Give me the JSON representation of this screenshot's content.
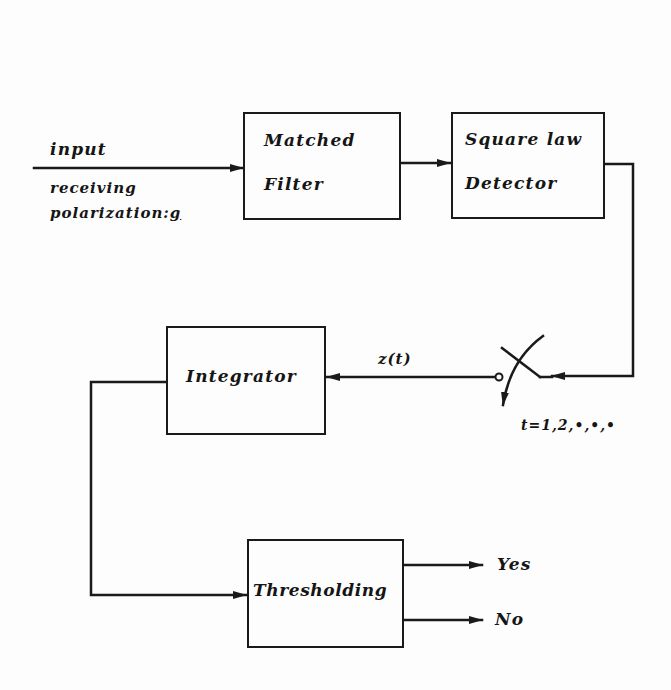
{
  "diagram": {
    "type": "block-diagram",
    "input": {
      "label": "input",
      "sublabel_line1": "receiving",
      "sublabel_line2_prefix": "polarization:",
      "sublabel_symbol": "g"
    },
    "blocks": [
      {
        "id": "matched-filter",
        "line1": "Matched",
        "line2": "Filter"
      },
      {
        "id": "square-law-detector",
        "line1": "Square law",
        "line2": "Detector"
      },
      {
        "id": "integrator",
        "line1": "Integrator"
      },
      {
        "id": "thresholding",
        "line1": "Thresholding"
      }
    ],
    "switch": {
      "signal_label": "z(t)",
      "sampling_label": "t=1,2,•,•,•"
    },
    "outputs": [
      {
        "label": "Yes"
      },
      {
        "label": "No"
      }
    ],
    "edges": [
      {
        "from": "input",
        "to": "matched-filter"
      },
      {
        "from": "matched-filter",
        "to": "square-law-detector"
      },
      {
        "from": "square-law-detector",
        "to": "switch"
      },
      {
        "from": "switch",
        "to": "integrator",
        "label": "z(t)"
      },
      {
        "from": "integrator",
        "to": "thresholding"
      },
      {
        "from": "thresholding",
        "to": "Yes"
      },
      {
        "from": "thresholding",
        "to": "No"
      }
    ],
    "colors": {
      "ink": "#1a1a1a",
      "paper": "#fdfdfd"
    }
  }
}
